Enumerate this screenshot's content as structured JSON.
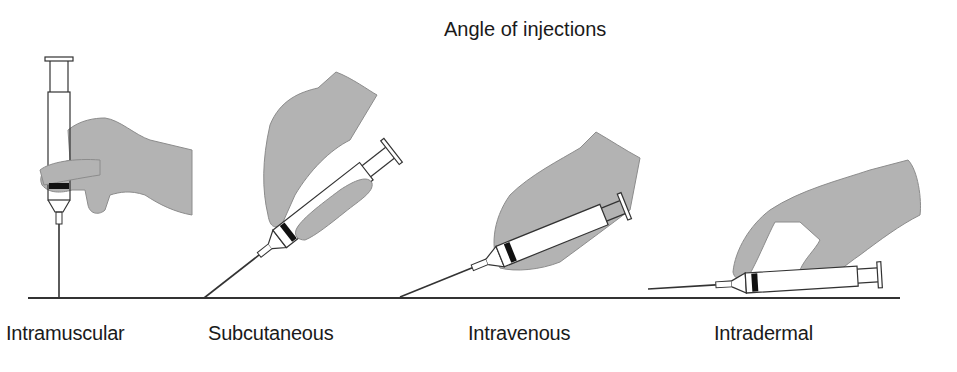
{
  "title": "Angle of injections",
  "colors": {
    "glove": "#b3b3b3",
    "glove_outline": "#8c8c8c",
    "line": "#333333",
    "stopper": "#111111",
    "background": "#ffffff"
  },
  "injections": [
    {
      "label": "Intramuscular",
      "angle_deg": 90
    },
    {
      "label": "Subcutaneous",
      "angle_deg": 45
    },
    {
      "label": "Intravenous",
      "angle_deg": 25
    },
    {
      "label": "Intradermal",
      "angle_deg": 10
    }
  ]
}
